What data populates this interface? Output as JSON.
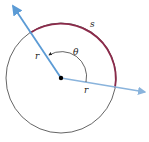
{
  "diagram": {
    "labels": {
      "arc": "s",
      "angle": "θ",
      "radius_upper": "r",
      "radius_lower": "r"
    },
    "colors": {
      "ray": "#5b9bd5",
      "arc": "#8b2a4a",
      "circle": "#222222",
      "center": "#000000"
    }
  }
}
